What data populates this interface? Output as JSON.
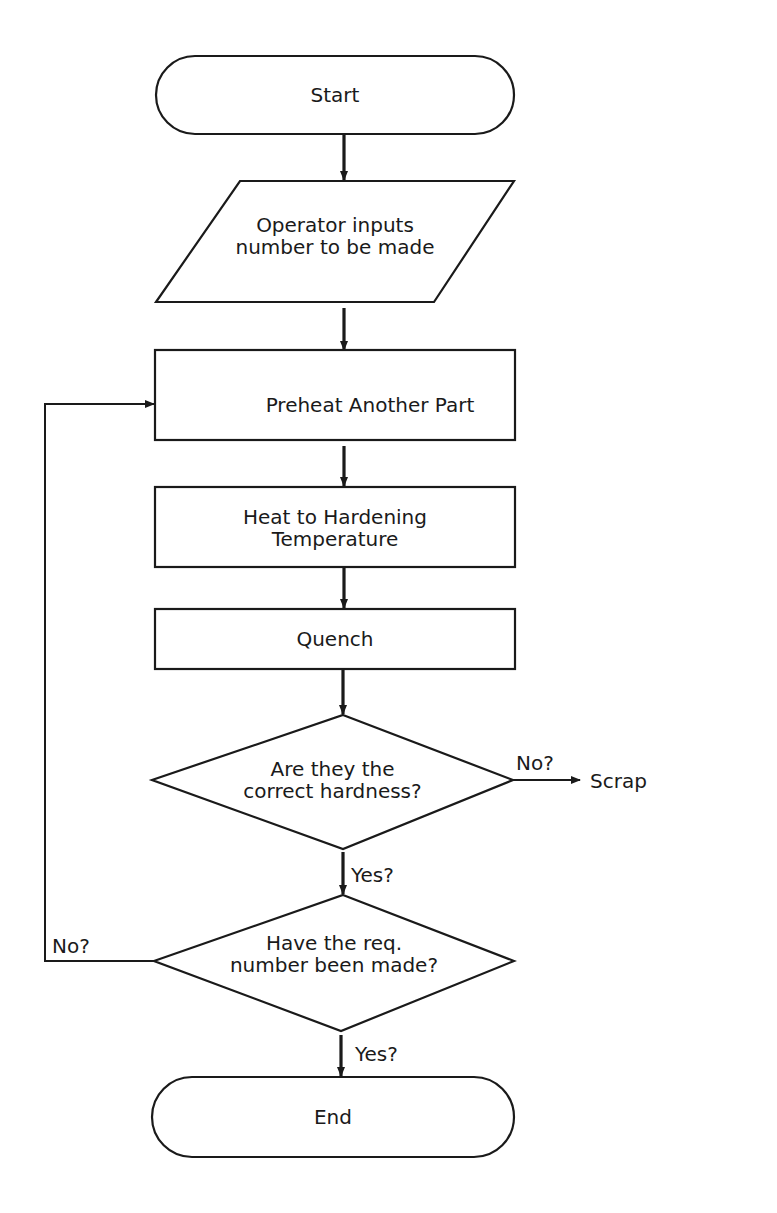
{
  "diagram": {
    "type": "flowchart",
    "nodes": [
      {
        "id": "start",
        "shape": "terminator",
        "text": "Start"
      },
      {
        "id": "input",
        "shape": "parallelogram",
        "line1": "Operator inputs",
        "line2": "number to be made"
      },
      {
        "id": "preheat",
        "shape": "rectangle",
        "text": "Preheat Another Part"
      },
      {
        "id": "heat",
        "shape": "rectangle",
        "line1": "Heat to Hardening",
        "line2": "Temperature"
      },
      {
        "id": "quench",
        "shape": "rectangle",
        "text": "Quench"
      },
      {
        "id": "hardness",
        "shape": "diamond",
        "line1": "Are they the",
        "line2": "correct hardness?"
      },
      {
        "id": "count",
        "shape": "diamond",
        "line1": "Have the req.",
        "line2": "number been made?"
      },
      {
        "id": "end",
        "shape": "terminator",
        "text": "End"
      },
      {
        "id": "scrap",
        "shape": "label",
        "text": "Scrap"
      }
    ],
    "edges": [
      {
        "from": "start",
        "to": "input",
        "label": ""
      },
      {
        "from": "input",
        "to": "preheat",
        "label": ""
      },
      {
        "from": "preheat",
        "to": "heat",
        "label": ""
      },
      {
        "from": "heat",
        "to": "quench",
        "label": ""
      },
      {
        "from": "quench",
        "to": "hardness",
        "label": ""
      },
      {
        "from": "hardness",
        "to": "scrap",
        "label": "No?"
      },
      {
        "from": "hardness",
        "to": "count",
        "label": "Yes?"
      },
      {
        "from": "count",
        "to": "preheat",
        "label": "No?"
      },
      {
        "from": "count",
        "to": "end",
        "label": "Yes?"
      }
    ]
  }
}
